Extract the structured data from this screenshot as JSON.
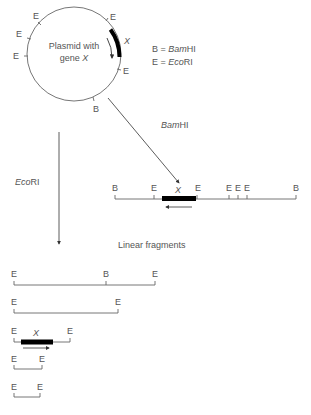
{
  "plasmid": {
    "title_line1": "Plasmid with",
    "title_line2_prefix": "gene ",
    "title_line2_gene": "X",
    "gene_label": "X",
    "site_labels": [
      "E",
      "E",
      "E",
      "E",
      "E",
      "B"
    ]
  },
  "legend": {
    "b_key": "B = ",
    "b_enzyme_italic": "Bam",
    "b_enzyme_rest": "HI",
    "e_key": "E = ",
    "e_enzyme_italic": "Eco",
    "e_enzyme_rest": "RI"
  },
  "bamhi_digest": {
    "enzyme_italic": "Bam",
    "enzyme_rest": "HI",
    "gene_label": "X",
    "site_labels": [
      "B",
      "E",
      "E",
      "E",
      "E",
      "E",
      "B"
    ]
  },
  "ecori_digest": {
    "enzyme_italic": "Eco",
    "enzyme_rest": "RI",
    "fragments_caption": "Linear fragments",
    "fragments": [
      {
        "labels": [
          "E",
          "B",
          "E"
        ]
      },
      {
        "labels": [
          "E",
          "E"
        ]
      },
      {
        "labels": [
          "E",
          "E"
        ],
        "gene_label": "X"
      },
      {
        "labels": [
          "E",
          "E"
        ]
      },
      {
        "labels": [
          "E",
          "E"
        ]
      }
    ]
  }
}
